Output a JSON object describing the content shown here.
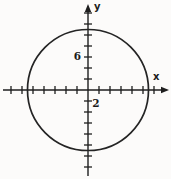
{
  "figure": {
    "background_color": "#fcfbfa",
    "ink_color": "#1e1e1e"
  },
  "chart_data": {
    "type": "line",
    "subtype": "coordinate-plane-geometry",
    "title": "",
    "xlabel": "x",
    "ylabel": "y",
    "grid": false,
    "x_axis": {
      "tick_step": 2,
      "tick_min": -14,
      "tick_max": 12,
      "axis_min": -15.5,
      "axis_max": 14.5,
      "labeled_ticks": [
        {
          "value": 2,
          "label": "2"
        }
      ]
    },
    "y_axis": {
      "tick_step": 2,
      "tick_min": -14,
      "tick_max": 14,
      "axis_min": -15.5,
      "axis_max": 15.5,
      "labeled_ticks": [
        {
          "value": 6,
          "label": "6"
        }
      ]
    },
    "shapes": [
      {
        "kind": "circle",
        "center": [
          0,
          0
        ],
        "radius": 11,
        "fill": "none"
      }
    ]
  }
}
